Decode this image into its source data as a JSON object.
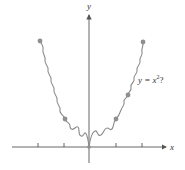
{
  "figure": {
    "axes": {
      "x_label": "x",
      "y_label": "y",
      "axis_color": "#555555"
    },
    "curve": {
      "label_lhs": "y = x",
      "label_exp": "2",
      "label_suffix": "?",
      "color": "#8a8a8a",
      "point_color": "#8f8f8f",
      "description": "wiggly approximation of a parabola passing through marked points"
    },
    "points": [
      {
        "x": -2,
        "y": 4
      },
      {
        "x": -1,
        "y": 1
      },
      {
        "x": 0,
        "y": 0
      },
      {
        "x": 1,
        "y": 1
      },
      {
        "x": 1.5,
        "y": 2.25
      },
      {
        "x": 2,
        "y": 4
      }
    ]
  }
}
